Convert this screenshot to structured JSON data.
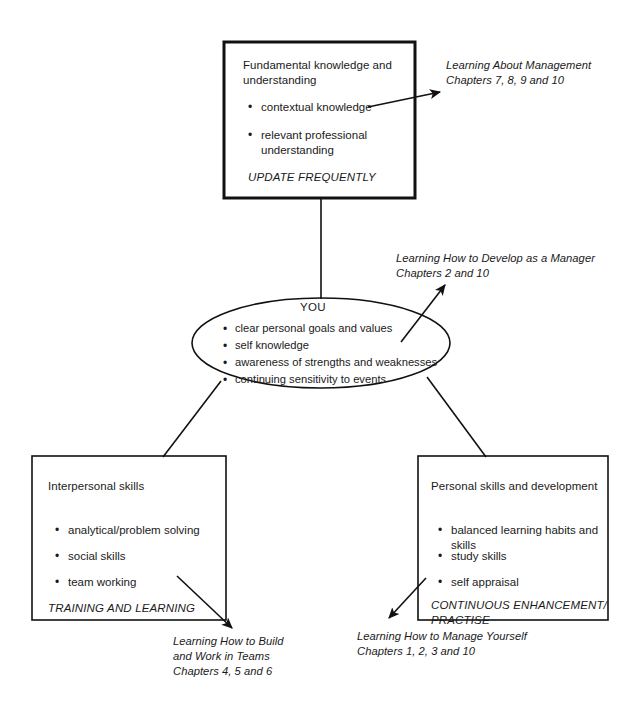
{
  "diagram": {
    "background_color": "#ffffff",
    "line_color": "#111111",
    "text_color": "#1a1a1a",
    "nodes": {
      "fundamental": {
        "heading": "Fundamental knowledge and\nunderstanding",
        "bullets": [
          "contextual knowledge",
          "relevant professional\nunderstanding"
        ],
        "emphasis": "UPDATE FREQUENTLY"
      },
      "you": {
        "label": "YOU",
        "bullets": [
          "clear personal goals and values",
          "self knowledge",
          "awareness of strengths and weaknesses",
          "continuing sensitivity to events"
        ]
      },
      "interpersonal": {
        "heading": "Interpersonal skills",
        "bullets": [
          "analytical/problem solving",
          "social skills",
          "team working"
        ],
        "emphasis": "TRAINING AND LEARNING"
      },
      "personal": {
        "heading": "Personal skills and development",
        "bullets": [
          "balanced learning habits and skills",
          "study skills",
          "self appraisal"
        ],
        "emphasis": "CONTINUOUS ENHANCEMENT/\nPRACTISE"
      }
    },
    "captions": {
      "about_management": "Learning About Management\nChapters 7, 8, 9 and 10",
      "develop_as_manager": "Learning How to Develop as a Manager\nChapters 2 and 10",
      "build_and_work_in_teams": "Learning How to Build\nand Work in Teams\nChapters 4, 5 and 6",
      "manage_yourself": "Learning How to Manage Yourself\nChapters 1, 2, 3 and 10"
    },
    "bullet_glyph": "•"
  }
}
